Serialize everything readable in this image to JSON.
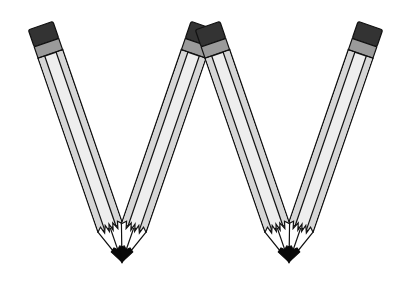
{
  "image": {
    "title": "Letter W made of pencils",
    "letter": "W",
    "background": "#ffffff"
  },
  "colors": {
    "outline": "#111111",
    "eraser": "#333333",
    "ferrule": "#9a9a9a",
    "body_light": "#eeeeee",
    "body_stripe": "#d4d4d4",
    "wood": "#ffffff",
    "lead": "#0a0a0a"
  },
  "pencils": [
    {
      "name": "pencil-1",
      "tip": [
        122,
        262
      ],
      "angle": -19
    },
    {
      "name": "pencil-2",
      "tip": [
        122,
        262
      ],
      "angle": 19
    },
    {
      "name": "pencil-3",
      "tip": [
        289,
        262
      ],
      "angle": -19
    },
    {
      "name": "pencil-4",
      "tip": [
        289,
        262
      ],
      "angle": 19
    }
  ]
}
